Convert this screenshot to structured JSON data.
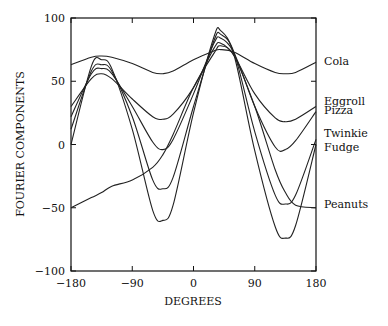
{
  "chart_data": {
    "type": "line",
    "title": "",
    "xlabel": "DEGREES",
    "ylabel": "FOURIER COMPONENTS",
    "xlim": [
      -180,
      180
    ],
    "ylim": [
      -100,
      100
    ],
    "xticks": [
      -180,
      -90,
      0,
      90,
      180
    ],
    "yticks": [
      -100,
      -50,
      0,
      50,
      100
    ],
    "xtick_labels": [
      "-180",
      "-90",
      "0",
      "90",
      "180"
    ],
    "ytick_labels": [
      "-100",
      "-50",
      "0",
      "50",
      "100"
    ],
    "grid": false,
    "legend_position": "right-edge-labels",
    "x": [
      -180,
      -150,
      -135,
      -120,
      -90,
      -60,
      -45,
      -30,
      0,
      30,
      40,
      60,
      90,
      120,
      135,
      150,
      180
    ],
    "series": [
      {
        "name": "Cola",
        "label_y": 66,
        "values": [
          63,
          69,
          70,
          69,
          64,
          57,
          56,
          58,
          67,
          74,
          75,
          73,
          64,
          57,
          56,
          57,
          65
        ]
      },
      {
        "name": "Eggroll",
        "label_y": 34,
        "values": [
          30,
          52,
          56,
          52,
          36,
          22,
          20,
          24,
          45,
          76,
          80,
          70,
          40,
          21,
          18,
          20,
          30
        ]
      },
      {
        "name": "Pizza",
        "label_y": 27,
        "values": [
          22,
          56,
          60,
          56,
          30,
          2,
          -4,
          4,
          40,
          80,
          84,
          72,
          30,
          -2,
          -4,
          3,
          26
        ]
      },
      {
        "name": "Twinkie",
        "label_y": 9,
        "values": [
          12,
          58,
          63,
          58,
          22,
          -28,
          -35,
          -26,
          30,
          82,
          87,
          72,
          10,
          -40,
          -47,
          -40,
          4
        ]
      },
      {
        "name": "Fudge",
        "label_y": -2,
        "values": [
          0,
          62,
          67,
          60,
          12,
          -52,
          -60,
          -48,
          25,
          85,
          90,
          70,
          -5,
          -65,
          -74,
          -64,
          0
        ]
      },
      {
        "name": "Peanuts",
        "label_y": -47,
        "values": [
          -50,
          -42,
          -38,
          -33,
          -28,
          -18,
          -8,
          8,
          45,
          72,
          78,
          70,
          30,
          -20,
          -38,
          -48,
          -50
        ]
      }
    ]
  }
}
